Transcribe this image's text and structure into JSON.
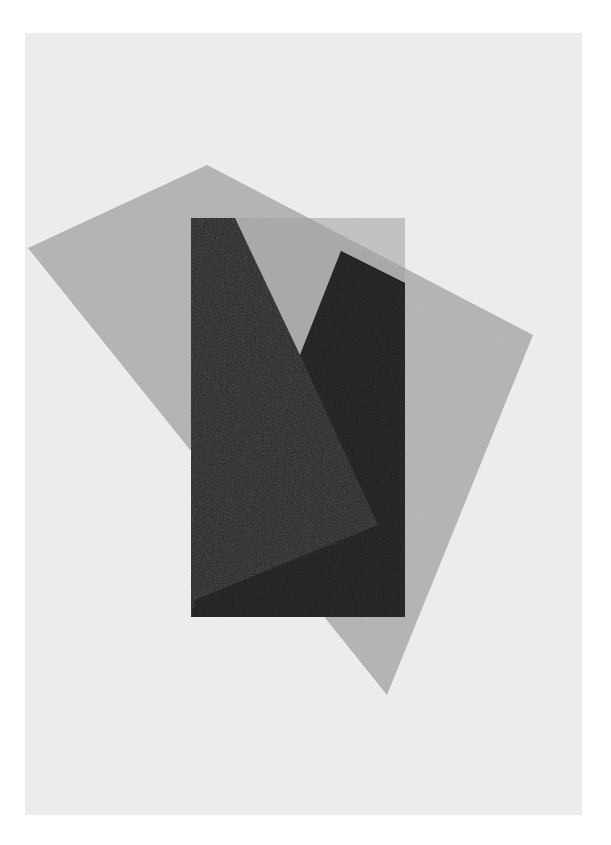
{
  "artwork": {
    "description": "Abstract composition: tilted translucent gray quadrilateral overlapping a vertical dark rectangle with a V-shaped notch",
    "colors": {
      "background": "#ffffff",
      "paper": "#ececec",
      "tilted_quad": "#8c8c8c",
      "dark_rect": "#1e1e1e",
      "notch_fill": "#bdbdbd"
    },
    "shapes": {
      "tilted_quad_points": "207,165 28,248 387,695 533,335",
      "dark_rect": {
        "x": 191,
        "y": 218,
        "width": 214,
        "height": 399
      },
      "light_rect_region_points": "191,218 405,218 405,617 191,617"
    }
  }
}
